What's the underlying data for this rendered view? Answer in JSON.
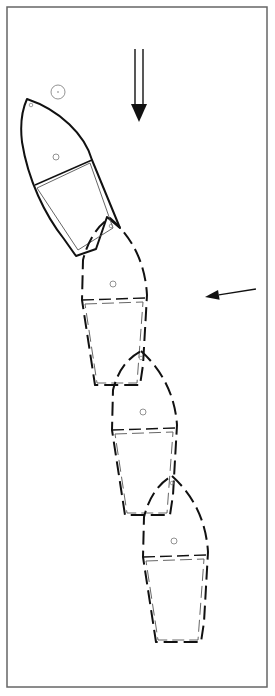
{
  "diagram": {
    "width": 275,
    "height": 696,
    "frame": {
      "x": 7,
      "y": 7,
      "w": 260,
      "h": 680,
      "color": "#666666"
    },
    "colors": {
      "stroke": "#111111",
      "inner": "#555555",
      "marker": "#777777",
      "arrow": "#111111"
    },
    "mark_circle": {
      "cx": 58,
      "cy": 92,
      "r": 7
    },
    "current_arrow": {
      "x1": 135,
      "x2": 143,
      "y_top": 49,
      "y_bottom": 104,
      "tip": 122,
      "head_half": 8,
      "label": ""
    },
    "wind_arrow": {
      "from": [
        256,
        289
      ],
      "to": [
        205,
        297
      ],
      "label": ""
    },
    "boats": [
      {
        "name": "position-1",
        "style": "solid",
        "hull": "M27,99 C60,110 85,135 92,160 L120,228 L107,217 L96,249 L76,256 L64,239 C45,215 28,180 22,142 C20,125 22,110 27,99 Z",
        "beam": "M35,185 L92,160",
        "cockpit": "M37,188 L90,163 L113,228 L78,250 Z",
        "bow_dot": [
          31,
          105
        ],
        "mast_dot": [
          56,
          157
        ]
      },
      {
        "name": "position-2",
        "style": "dashed",
        "hull": "M110,218 C130,235 145,260 147,295 L143,365 L140,385 L95,385 L82,300 L83,260 C88,240 98,225 110,218 Z",
        "beam": "M82,300 L146,298",
        "cockpit": "M85,304 L143,302 L137,383 L97,383 Z",
        "bow_dot": [
          111,
          226
        ],
        "mast_dot": [
          113,
          284
        ]
      },
      {
        "name": "position-3",
        "style": "dashed",
        "hull": "M141,351 C162,370 175,395 177,425 L173,495 L170,515 L125,515 L112,430 L113,390 C118,370 128,358 141,351 Z",
        "beam": "M112,430 L176,428",
        "cockpit": "M115,434 L173,432 L167,513 L127,513 Z",
        "bow_dot": [
          141,
          358
        ],
        "mast_dot": [
          143,
          412
        ]
      },
      {
        "name": "position-4",
        "style": "dashed",
        "hull": "M172,476 C193,495 206,520 208,552 L204,622 L201,642 L156,642 L143,557 L144,517 C149,497 159,483 172,476 Z",
        "beam": "M143,557 L207,555",
        "cockpit": "M146,561 L204,559 L198,640 L158,640 Z",
        "bow_dot": [
          172,
          483
        ],
        "mast_dot": [
          174,
          541
        ]
      }
    ]
  }
}
